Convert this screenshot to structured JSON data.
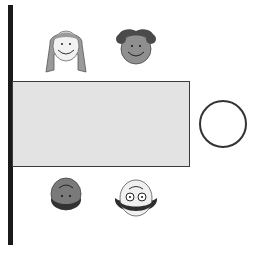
{
  "diagram": {
    "wall": {
      "side": "left",
      "color": "#1a1a1a"
    },
    "table": {
      "shape": "rectangle",
      "fill": "#e3e3e3"
    },
    "people": [
      {
        "id": "girl-long-hair",
        "position": "top-left",
        "orientation": "upright"
      },
      {
        "id": "girl-curly-hair",
        "position": "top-right",
        "orientation": "upright"
      },
      {
        "id": "boy-dark",
        "position": "bottom-left",
        "orientation": "upside-down"
      },
      {
        "id": "person-glasses",
        "position": "bottom-right",
        "orientation": "upside-down"
      }
    ],
    "empty_seat": {
      "shape": "circle",
      "position": "right-end"
    }
  }
}
